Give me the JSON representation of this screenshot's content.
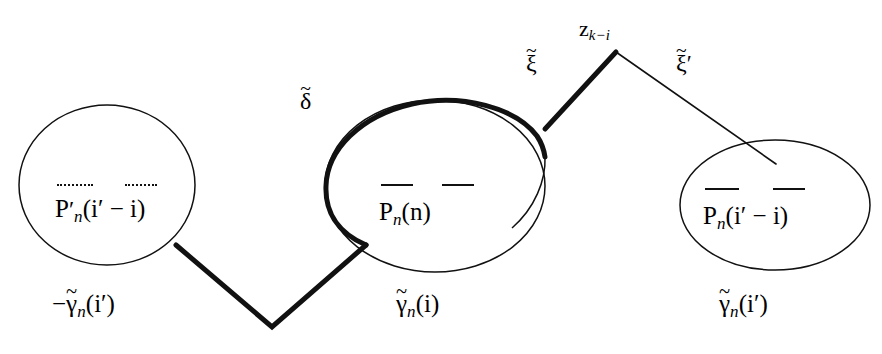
{
  "figure": {
    "type": "mathematical-diagram",
    "background_color": "#ffffff",
    "ink_color": "#111111",
    "thick_stroke_width": 5,
    "thin_stroke_width": 1.4
  },
  "regions": [
    {
      "id": "left-ellipse",
      "label_main": "P",
      "label_sub": "n",
      "label_prime": "′",
      "label_args": "(i′ − i)",
      "overline_style": "dotted",
      "stroke": "thin",
      "cx": 107,
      "cy": 185,
      "rx": 88,
      "ry": 80
    },
    {
      "id": "middle-ellipse",
      "label_main": "P",
      "label_sub": "n",
      "label_prime": "",
      "label_args": "(n)",
      "overline_style": "solid",
      "stroke": "mixed",
      "cx": 435,
      "cy": 186,
      "rx": 110,
      "ry": 86
    },
    {
      "id": "right-ellipse",
      "label_main": "P",
      "label_sub": "n",
      "label_prime": "",
      "label_args": "(i′ − i)",
      "overline_style": "solid",
      "stroke": "thin",
      "cx": 775,
      "cy": 205,
      "rx": 95,
      "ry": 65
    }
  ],
  "curve_labels": [
    {
      "id": "delta-label",
      "base": "δ",
      "accent": "~",
      "prime": "",
      "x": 300,
      "y": 88
    },
    {
      "id": "xi-label",
      "base": "ξ",
      "accent": "~",
      "prime": "",
      "x": 524,
      "y": 50
    },
    {
      "id": "xi-prime-label",
      "base": "ξ",
      "accent": "~",
      "prime": "′",
      "x": 676,
      "y": 50
    }
  ],
  "node_labels": [
    {
      "id": "z-node-label",
      "base": "z",
      "sub": "k−i",
      "x": 576,
      "y": 16
    }
  ],
  "bottom_labels": [
    {
      "id": "left-gamma",
      "sign": "−",
      "base": "γ",
      "accent": "~",
      "sub": "n",
      "args": "(i′)",
      "x": 48,
      "y": 290
    },
    {
      "id": "middle-gamma",
      "sign": "",
      "base": "γ",
      "accent": "~",
      "sub": "n",
      "args": "(i)",
      "x": 393,
      "y": 290
    },
    {
      "id": "right-gamma",
      "sign": "",
      "base": "γ",
      "accent": "~",
      "sub": "n",
      "args": "(i′)",
      "x": 716,
      "y": 290
    }
  ],
  "paths": {
    "left_zigzag": {
      "from": [
        176,
        245
      ],
      "vertex": [
        272,
        327
      ],
      "to": [
        366,
        245
      ],
      "stroke": "thick"
    },
    "xi_segment": {
      "from": [
        545,
        127
      ],
      "to": [
        615,
        52
      ],
      "stroke": "thick"
    },
    "xi_prime_segment": {
      "from": [
        615,
        52
      ],
      "to": [
        776,
        163
      ],
      "stroke": "thin"
    }
  }
}
